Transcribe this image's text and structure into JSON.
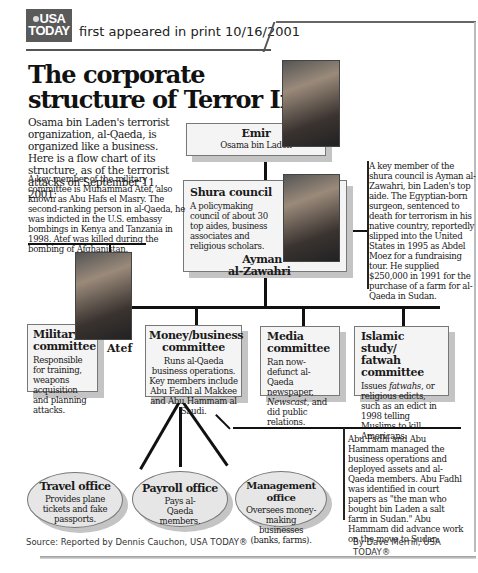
{
  "header": {
    "logo_line1": "USA",
    "logo_line2": "TODAY",
    "printed": "first appeared in print 10/16/2001"
  },
  "title": {
    "line1": "The corporate",
    "line2": "structure of Terror Inc."
  },
  "intro": "Osama bin Laden's terrorist organization, al-Qaeda, is organized like a business. Here is a flow chart of its structure, as of the terrorist attacks on September 11, 2001:",
  "notes": {
    "atef": "A key member of the military committee is Muhammad Atef, also known as Abu Hafs el Masry. The second-ranking person in al-Qaeda, he was indicted in the U.S. embassy bombings in Kenya and Tanzania in 1998. Atef was killed during the bombing of Afghanistan.",
    "zawahri": "A key member of the shura council is Ayman al-Zawahri, bin Laden's top aide. The Egyptian-born surgeon, sentenced to death for terrorism in his native country, reportedly slipped into the United States in 1995 as Abdel Moez for a fundraising tour. He supplied $250,000 in 1991 for the purchase of a farm for al-Qaeda in Sudan.",
    "money": "Abu Fadhl and Abu Hammam managed the business operations and deployed assets and al-Qaeda members. Abu Fadhl was identified in court papers as \"the man who bought bin Laden a salt farm in Sudan.\" Abu Hammam did advance work on the move to Sudan."
  },
  "nodes": {
    "emir": {
      "title": "Emir",
      "subtitle": "Osama bin Laden"
    },
    "shura": {
      "title": "Shura council",
      "desc": "A policymaking council of about 30 top aides, business associates and religious scholars.",
      "person_line1": "Ayman",
      "person_line2": "al-Zawahri"
    },
    "military": {
      "title_line1": "Military",
      "title_line2": "committee",
      "desc": "Responsible for training, weapons acquisition and planning attacks.",
      "person": "Atef"
    },
    "money": {
      "title_line1": "Money/business",
      "title_line2": "committee",
      "desc": "Runs al-Qaeda business operations. Key members include Abu Fadhl al Makkee and Abu Hammam al Saudi."
    },
    "media": {
      "title_line1": "Media",
      "title_line2": "committee",
      "desc_1": "Ran now-defunct al-Qaeda newspaper, ",
      "desc_italic": "Newscast",
      "desc_2": ", and did public relations."
    },
    "islamic": {
      "title_line1": "Islamic study/",
      "title_line2": "fatwah committee",
      "desc_1": "Issues ",
      "desc_italic": "fatwahs",
      "desc_2": ", or religious edicts, such as an edict in 1998 telling Muslims to kill Americans."
    }
  },
  "offices": [
    {
      "title": "Travel office",
      "desc": "Provides plane tickets and fake passports."
    },
    {
      "title": "Payroll office",
      "desc": "Pays al-Qaeda members."
    },
    {
      "title": "Management office",
      "desc": "Oversees money-making businesses (banks, farms)."
    }
  ],
  "footer": {
    "source": "Source: Reported by Dennis Cauchon, USA TODAY®",
    "byline": "By Dave Merrill, USA TODAY®"
  }
}
